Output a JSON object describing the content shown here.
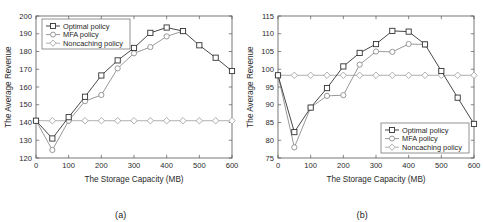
{
  "figure": {
    "panels": [
      {
        "caption": "(a)",
        "xlabel": "The Storage Capacity (MB)",
        "ylabel": "The Average Revenue"
      },
      {
        "caption": "(b)",
        "xlabel": "The Storage Capacity (MB)",
        "ylabel": "The Average Revenue"
      }
    ]
  },
  "chart_data": [
    {
      "type": "line",
      "title": "",
      "panel": "(a)",
      "xlabel": "The Storage Capacity (MB)",
      "ylabel": "The Average Revenue",
      "xlim": [
        0,
        600
      ],
      "ylim": [
        120,
        200
      ],
      "xticks": [
        0,
        100,
        200,
        300,
        400,
        500,
        600
      ],
      "yticks": [
        120,
        130,
        140,
        150,
        160,
        170,
        180,
        190,
        200
      ],
      "grid": false,
      "legend_position": "top-left",
      "x": [
        0,
        50,
        100,
        150,
        200,
        250,
        300,
        350,
        400,
        450,
        500,
        550,
        600
      ],
      "series": [
        {
          "name": "Optimal policy",
          "marker": "square",
          "color": "#333333",
          "values": [
            141,
            131,
            143,
            154.5,
            166.5,
            175,
            182,
            190.5,
            193.5,
            191.5,
            183.5,
            176.5,
            169
          ]
        },
        {
          "name": "MFA policy",
          "marker": "circle",
          "color": "#8c8c8c",
          "values": [
            141,
            124.5,
            141,
            152,
            155.5,
            170.5,
            179,
            182.5,
            188.5,
            191.5,
            null,
            null,
            null
          ]
        },
        {
          "name": "Noncaching policy",
          "marker": "diamond",
          "color": "#a6a6a6",
          "values": [
            141,
            141,
            141,
            141,
            141,
            141,
            141,
            141,
            141,
            141,
            141,
            141,
            141
          ]
        }
      ]
    },
    {
      "type": "line",
      "title": "",
      "panel": "(b)",
      "xlabel": "The Storage Capacity (MB)",
      "ylabel": "The Average Revenue",
      "xlim": [
        0,
        600
      ],
      "ylim": [
        75,
        115
      ],
      "xticks": [
        0,
        100,
        200,
        300,
        400,
        500,
        600
      ],
      "yticks": [
        75,
        80,
        85,
        90,
        95,
        100,
        105,
        110,
        115
      ],
      "grid": false,
      "legend_position": "bottom-right",
      "x": [
        0,
        50,
        100,
        150,
        200,
        250,
        300,
        350,
        400,
        450,
        500,
        550,
        600
      ],
      "series": [
        {
          "name": "Optimal policy",
          "marker": "square",
          "color": "#333333",
          "values": [
            98.3,
            82.3,
            89.2,
            94.7,
            100.8,
            104.6,
            107.1,
            110.8,
            110.6,
            107,
            99.5,
            92,
            84.6
          ]
        },
        {
          "name": "MFA policy",
          "marker": "circle",
          "color": "#8c8c8c",
          "values": [
            98.3,
            78,
            89.2,
            92.5,
            92.7,
            101.3,
            105,
            104.9,
            107.1,
            107,
            null,
            null,
            null
          ]
        },
        {
          "name": "Noncaching policy",
          "marker": "diamond",
          "color": "#a6a6a6",
          "values": [
            98.3,
            98.3,
            98.3,
            98.3,
            98.3,
            98.3,
            98.3,
            98.3,
            98.3,
            98.3,
            98.3,
            98.3,
            98.3
          ]
        }
      ]
    }
  ]
}
